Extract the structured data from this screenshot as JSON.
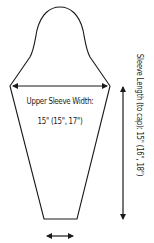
{
  "diagram": {
    "type": "sleeve-schematic",
    "stroke_color": "#1a1a1a",
    "background": "#ffffff",
    "upper_sleeve_width": {
      "label": "Upper Sleeve Width:",
      "value": "15\" (15\", 17\")"
    },
    "sleeve_length": {
      "label": "Sleeve Length (to cap):  15\" (16\", 18\")"
    },
    "cuff_width": {
      "label": ""
    }
  }
}
